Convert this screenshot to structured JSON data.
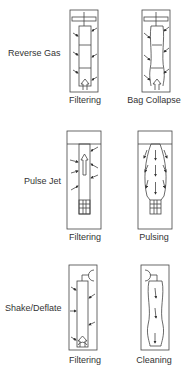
{
  "rows": [
    {
      "label": "Reverse Gas",
      "panels": [
        {
          "caption": "Filtering",
          "state": "filtering"
        },
        {
          "caption": "Bag Collapse",
          "state": "collapse"
        }
      ]
    },
    {
      "label": "Pulse Jet",
      "panels": [
        {
          "caption": "Filtering",
          "state": "filtering"
        },
        {
          "caption": "Pulsing",
          "state": "pulsing"
        }
      ]
    },
    {
      "label": "Shake/Deflate",
      "panels": [
        {
          "caption": "Filtering",
          "state": "filtering"
        },
        {
          "caption": "Cleaning",
          "state": "cleaning"
        }
      ]
    }
  ],
  "colors": {
    "line": "#444444",
    "text": "#333333",
    "background": "#ffffff"
  }
}
